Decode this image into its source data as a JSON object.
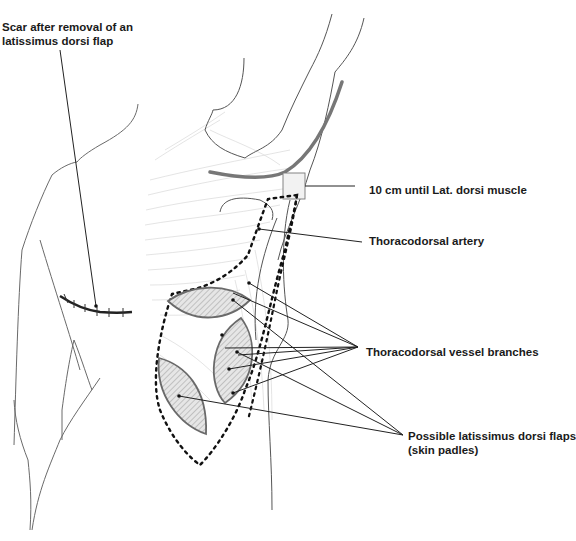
{
  "figure": {
    "type": "anatomical-illustration",
    "colors": {
      "outline": "#555555",
      "leader_line": "#222222",
      "dashed_boundary": "#111111",
      "flap_fill": "#d8d8d8",
      "flap_stroke": "#6a6a6a",
      "muscle_hatch": "#c8c8c8",
      "axilla_crease": "#777777"
    }
  },
  "labels": {
    "scar": {
      "line1": "Scar after removal of an",
      "line2": "latissimus dorsi flap"
    },
    "distance": "10 cm until Lat. dorsi muscle",
    "artery": "Thoracodorsal artery",
    "branches": "Thoracodorsal vessel branches",
    "flaps": {
      "line1": "Possible latissimus dorsi flaps",
      "line2": "(skin padles)"
    }
  },
  "annotations": [
    {
      "id": "scar",
      "target": "sutured scar on back",
      "pointer_count": 1
    },
    {
      "id": "distance",
      "target": "rectangle marker at axilla",
      "pointer_count": 1
    },
    {
      "id": "artery",
      "target": "thoracodorsal artery",
      "pointer_count": 1
    },
    {
      "id": "branches",
      "target": "vessel branches",
      "pointer_count": 5
    },
    {
      "id": "flaps",
      "target": "three skin paddles",
      "pointer_count": 3
    }
  ]
}
